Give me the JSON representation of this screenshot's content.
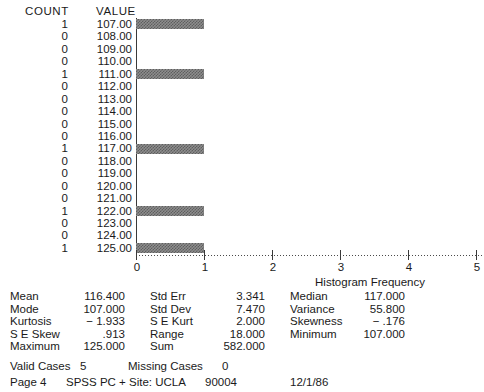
{
  "table_headers": {
    "count": "COUNT",
    "value": "VALUE"
  },
  "chart_data": {
    "type": "bar",
    "orientation": "horizontal",
    "title": "",
    "xlabel": "Histogram Frequency",
    "ylabel": "",
    "categories": [
      "107.00",
      "108.00",
      "109.00",
      "110.00",
      "111.00",
      "112.00",
      "113.00",
      "114.00",
      "115.00",
      "116.00",
      "117.00",
      "118.00",
      "119.00",
      "120.00",
      "121.00",
      "122.00",
      "123.00",
      "124.00",
      "125.00"
    ],
    "values": [
      1,
      0,
      0,
      0,
      1,
      0,
      0,
      0,
      0,
      0,
      1,
      0,
      0,
      0,
      0,
      1,
      0,
      0,
      1
    ],
    "counts": [
      "1",
      "0",
      "0",
      "0",
      "1",
      "0",
      "0",
      "0",
      "0",
      "0",
      "1",
      "0",
      "0",
      "0",
      "0",
      "1",
      "0",
      "0",
      "1"
    ],
    "xlim": [
      0,
      5
    ],
    "xticks": [
      0,
      1,
      2,
      3,
      4,
      5
    ],
    "xticklabels": [
      "0",
      "1",
      "2",
      "3",
      "4",
      "5"
    ],
    "grid": false,
    "legend": false,
    "bar_color": "#8d8d8d"
  },
  "statistics": {
    "columns": [
      {
        "rows": [
          {
            "label": "Mean",
            "value": "116.400"
          },
          {
            "label": "Mode",
            "value": "107.000"
          },
          {
            "label": "Kurtosis",
            "value": "− 1.933"
          },
          {
            "label": "S E Skew",
            "value": ".913"
          },
          {
            "label": "Maximum",
            "value": "125.000"
          }
        ]
      },
      {
        "rows": [
          {
            "label": "Std Err",
            "value": "3.341"
          },
          {
            "label": "Std Dev",
            "value": "7.470"
          },
          {
            "label": "S E Kurt",
            "value": "2.000"
          },
          {
            "label": "Range",
            "value": "18.000"
          },
          {
            "label": "Sum",
            "value": "582.000"
          }
        ]
      },
      {
        "rows": [
          {
            "label": "Median",
            "value": "117.000"
          },
          {
            "label": "Variance",
            "value": "55.800"
          },
          {
            "label": "Skewness",
            "value": "− .176"
          },
          {
            "label": "Minimum",
            "value": "107.000"
          },
          {
            "label": "",
            "value": ""
          }
        ]
      }
    ]
  },
  "footer": {
    "valid_cases_label": "Valid Cases",
    "valid_cases_value": "5",
    "missing_cases_label": "Missing Cases",
    "missing_cases_value": "0",
    "page_label": "Page 4",
    "site_label": "SPSS PC + Site: UCLA",
    "zip_label": "90004",
    "date_label": "12/1/86"
  }
}
